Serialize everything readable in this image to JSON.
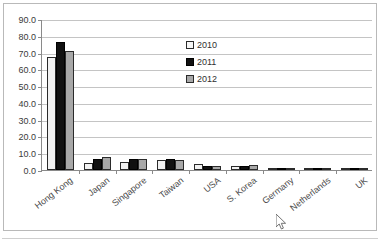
{
  "chart_data": {
    "type": "bar",
    "title": "",
    "xlabel": "",
    "ylabel": "",
    "ylim": [
      0,
      90
    ],
    "yticks": [
      "0.0",
      "10.0",
      "20.0",
      "30.0",
      "40.0",
      "50.0",
      "60.0",
      "70.0",
      "80.0",
      "90.0"
    ],
    "grid": true,
    "legend_position": "inside-upper-center",
    "categories": [
      "Hong Kong",
      "Japan",
      "Singapore",
      "Taiwan",
      "USA",
      "S. Korea",
      "Germany",
      "Netherlands",
      "UK"
    ],
    "series": [
      {
        "name": "2010",
        "color": "#f2f2f2",
        "values": [
          67.5,
          4.0,
          5.0,
          6.0,
          3.5,
          2.5,
          0.8,
          0.8,
          0.6
        ]
      },
      {
        "name": "2011",
        "color": "#111111",
        "values": [
          76.5,
          6.5,
          6.5,
          6.5,
          2.5,
          2.5,
          1.0,
          1.2,
          1.2
        ]
      },
      {
        "name": "2012",
        "color": "#a8a8a8",
        "values": [
          71.0,
          7.5,
          6.5,
          6.0,
          2.5,
          3.0,
          1.0,
          1.0,
          0.8
        ]
      }
    ]
  },
  "cursor": {
    "icon": "mouse-pointer-icon"
  }
}
